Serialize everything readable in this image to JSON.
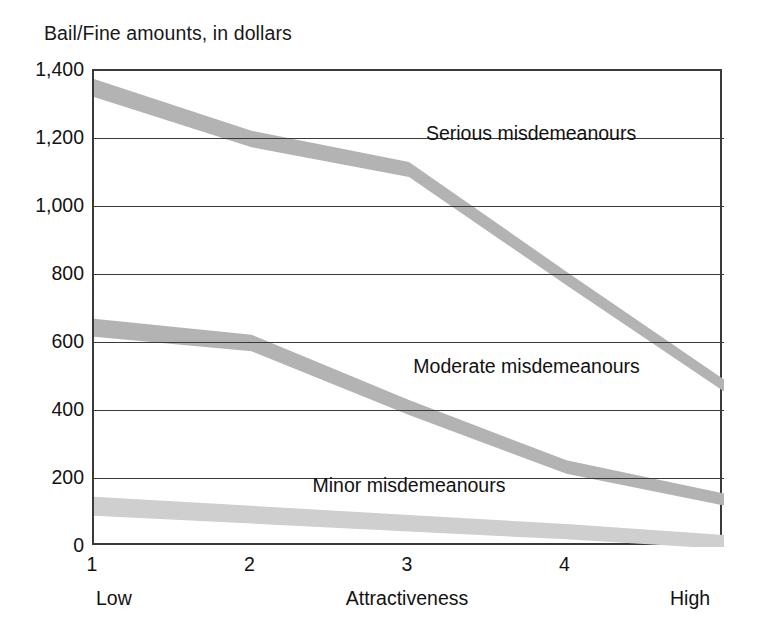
{
  "chart_data": {
    "type": "line",
    "title": "Bail/Fine amounts, in dollars",
    "xlabel": "Attractiveness",
    "ylabel": "",
    "x": [
      1,
      2,
      3,
      4,
      5
    ],
    "categories": [
      "1",
      "2",
      "3",
      "4",
      "5"
    ],
    "xtick_labels": [
      "1",
      "2",
      "3",
      "4"
    ],
    "x_endpoint_labels": {
      "low": "Low",
      "high": "High"
    },
    "ytick_labels": [
      "0",
      "200",
      "400",
      "600",
      "800",
      "1,000",
      "1,200",
      "1,400"
    ],
    "ytick_values": [
      0,
      200,
      400,
      600,
      800,
      1000,
      1200,
      1400
    ],
    "ylim": [
      0,
      1400
    ],
    "xlim": [
      1,
      5
    ],
    "grid": true,
    "grid_axis": "y",
    "legend_position": "inline-annotations",
    "series": [
      {
        "name": "Serious misdemeanours",
        "values": [
          1350,
          1200,
          1110,
          790,
          475
        ],
        "color": "#b3b3b3",
        "label_x_frac": 0.53,
        "label_y_value": 1205
      },
      {
        "name": "Moderate misdemeanours",
        "values": [
          645,
          600,
          410,
          235,
          140
        ],
        "color": "#b3b3b3",
        "label_x_frac": 0.51,
        "label_y_value": 520
      },
      {
        "name": "Minor misdemeanours",
        "values": [
          120,
          95,
          70,
          45,
          15
        ],
        "color": "#cfcfcf",
        "label_x_frac": 0.35,
        "label_y_value": 170
      }
    ],
    "annotations": [
      {
        "text": "Serious misdemeanours",
        "value": 1205
      },
      {
        "text": "Moderate misdemeanours",
        "value": 520
      },
      {
        "text": "Minor misdemeanours",
        "value": 170
      }
    ],
    "colors": {
      "axis": "#3a3a3a",
      "grid": "#3a3a3a",
      "text": "#121212",
      "band_dark": "#b3b3b3",
      "band_light": "#cfcfcf",
      "background": "#ffffff"
    }
  }
}
